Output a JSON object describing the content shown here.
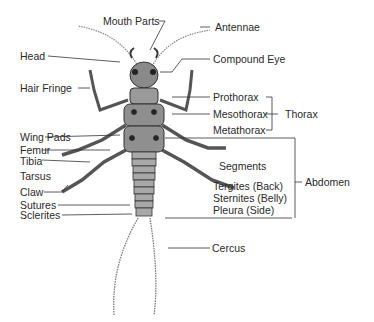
{
  "diagram": {
    "colors": {
      "ink": "#2a2a2a",
      "background": "#ffffff",
      "body_shade": "#6a6a6a"
    },
    "labels": {
      "mouth_parts": "Mouth Parts",
      "antennae": "Antennae",
      "head": "Head",
      "compound_eye": "Compound Eye",
      "hair_fringe": "Hair Fringe",
      "prothorax": "Prothorax",
      "mesothorax": "Mesothorax",
      "metathorax": "Metathorax",
      "thorax": "Thorax",
      "wing_pads": "Wing Pads",
      "femur": "Femur",
      "tibia": "Tibia",
      "tarsus": "Tarsus",
      "claw": "Claw",
      "segments": "Segments",
      "tergites": "Tergites (Back)",
      "sternites": "Sternites (Belly)",
      "pleura": "Pleura (Side)",
      "abdomen": "Abdomen",
      "sutures": "Sutures",
      "sclerites": "Sclerites",
      "cercus": "Cercus"
    }
  }
}
